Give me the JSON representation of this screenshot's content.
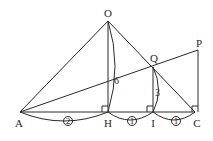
{
  "points": {
    "O": "O",
    "A": "A",
    "H": "H",
    "I": "I",
    "C": "C",
    "P": "P",
    "Q": "Q"
  },
  "lengths": {
    "OH": "6",
    "QI": "3"
  },
  "ratios": {
    "AH": "2",
    "HI": "1",
    "IC": "1"
  },
  "colors": {
    "line": "#2a2a2a",
    "background": "#ffffff"
  }
}
